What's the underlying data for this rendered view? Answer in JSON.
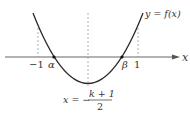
{
  "diagram": {
    "type": "parabola-graph",
    "colors": {
      "curve": "#2a2a2a",
      "axis": "#555555",
      "dashed": "#999999",
      "text": "#333333"
    },
    "axis_label": "x",
    "curve_label": "y = f(x)",
    "tick_labels": {
      "neg_one": "−1",
      "alpha": "α",
      "beta": "β",
      "one": "1"
    },
    "axis_of_symmetry": {
      "prefix": "x = −",
      "numerator": "k + 1",
      "denominator": "2"
    }
  }
}
